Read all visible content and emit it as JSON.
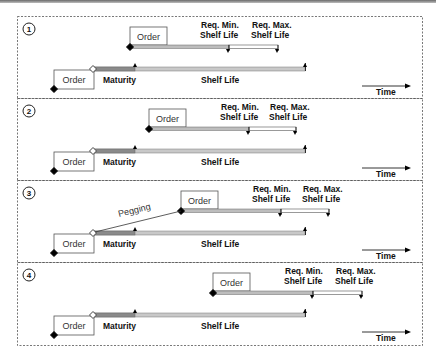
{
  "diagram": {
    "colors": {
      "border": "#555555",
      "maturity_bar": "#8a8a8a",
      "shelf_bar": "#c8c8c8",
      "min_bar": "#bdbdbd",
      "max_bar": "#ffffff",
      "marker": "#000000"
    },
    "labels": {
      "order": "Order",
      "maturity": "Maturity",
      "shelf_life": "Shelf Life",
      "req_min_1": "Req. Min.",
      "req_min_2": "Shelf Life",
      "req_max_1": "Req. Max.",
      "req_max_2": "Shelf Life",
      "time": "Time",
      "pegging": "Pegging"
    },
    "panels": [
      {
        "number": "1",
        "top": 16,
        "height": 82,
        "upper_start": 130,
        "min_end": 229,
        "max_end": 278,
        "pegging": false
      },
      {
        "number": "2",
        "top": 98,
        "height": 82,
        "upper_start": 149,
        "min_end": 249,
        "max_end": 296,
        "pegging": false
      },
      {
        "number": "3",
        "top": 180,
        "height": 82,
        "upper_start": 181,
        "min_end": 281,
        "max_end": 329,
        "pegging": true
      },
      {
        "number": "4",
        "top": 262,
        "height": 83,
        "upper_start": 213,
        "min_end": 313,
        "max_end": 362,
        "pegging": false
      }
    ],
    "lower": {
      "order_box_x": 54,
      "order_box_w": 40,
      "diamond_x": 93,
      "maturity_end": 135,
      "shelf_end": 305
    }
  }
}
